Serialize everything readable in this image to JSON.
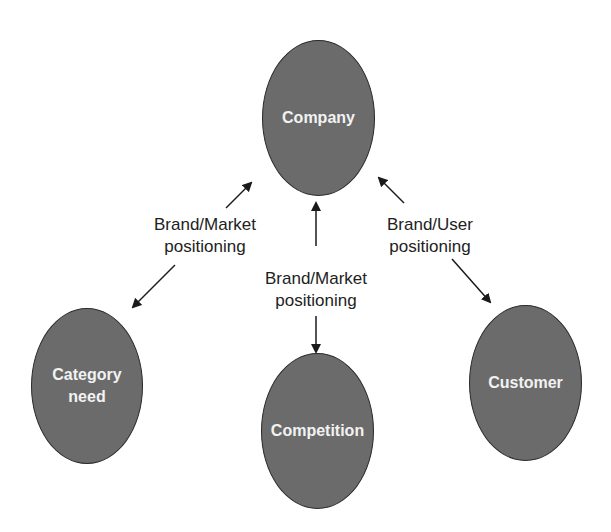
{
  "nodes": {
    "company": "Company",
    "category_need": "Category\nneed",
    "competition": "Competition",
    "customer": "Customer"
  },
  "edges": [
    {
      "from": "company",
      "to": "category_need",
      "label": "Brand/Market\npositioning",
      "direction": "bidirectional"
    },
    {
      "from": "company",
      "to": "competition",
      "label": "Brand/Market\npositioning",
      "direction": "bidirectional"
    },
    {
      "from": "company",
      "to": "customer",
      "label": "Brand/User\npositioning",
      "direction": "bidirectional"
    }
  ],
  "colors": {
    "node_fill": "#6b6b6b",
    "node_text": "#f2f2f2",
    "arrow": "#1a1a1a"
  }
}
